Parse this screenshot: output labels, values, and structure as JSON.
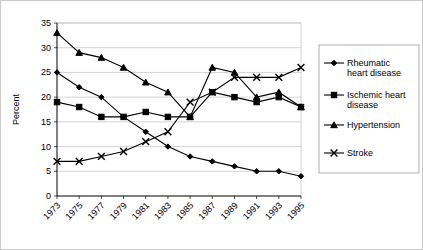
{
  "chart_data": {
    "type": "line",
    "title": "",
    "subtitle": "",
    "xlabel": "",
    "ylabel": "Percent",
    "ylim": [
      0,
      35
    ],
    "ytick_step": 5,
    "yticks": [
      "0",
      "5",
      "10",
      "15",
      "20",
      "25",
      "30",
      "35"
    ],
    "grid": true,
    "legend_position": "right",
    "x": [
      1973,
      1975,
      1977,
      1979,
      1981,
      1983,
      1985,
      1987,
      1989,
      1991,
      1993,
      1995
    ],
    "categories": [
      "1973",
      "1975",
      "1977",
      "1979",
      "1981",
      "1983",
      "1985",
      "1987",
      "1989",
      "1991",
      "1993",
      "1995"
    ],
    "series": [
      {
        "name": "Rheumatic heart disease",
        "marker": "diamond",
        "values": [
          25,
          22,
          20,
          16,
          13,
          10,
          8,
          7,
          6,
          5,
          5,
          4
        ]
      },
      {
        "name": "Ischemic heart disease",
        "marker": "square",
        "values": [
          19,
          18,
          16,
          16,
          17,
          16,
          16,
          21,
          20,
          19,
          20,
          18
        ]
      },
      {
        "name": "Hypertension",
        "marker": "triangle",
        "values": [
          33,
          29,
          28,
          26,
          23,
          21,
          16,
          26,
          25,
          20,
          21,
          18
        ]
      },
      {
        "name": "Stroke",
        "marker": "x",
        "values": [
          7,
          7,
          8,
          9,
          11,
          13,
          19,
          21,
          24,
          24,
          24,
          26
        ]
      }
    ]
  },
  "legend": {
    "entries": [
      {
        "label_line1": "Rheumatic",
        "label_line2": "heart disease",
        "marker": "diamond"
      },
      {
        "label_line1": "Ischemic heart",
        "label_line2": "disease",
        "marker": "square"
      },
      {
        "label_line1": "Hypertension",
        "label_line2": "",
        "marker": "triangle"
      },
      {
        "label_line1": "Stroke",
        "label_line2": "",
        "marker": "x"
      }
    ]
  },
  "colors": {
    "series": "#000000",
    "grid": "#c0c0c0",
    "axis": "#000000",
    "frame": "#c9c9c9",
    "background": "#ffffff"
  }
}
